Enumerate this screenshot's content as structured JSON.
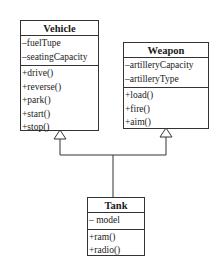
{
  "diagram": {
    "type": "uml-class-diagram",
    "classes": {
      "vehicle": {
        "name": "Vehicle",
        "attributes": [
          "–fuelTupe",
          "–seatingCapacity"
        ],
        "methods": [
          "+drive()",
          "+reverse()",
          "+park()",
          "+start()",
          "+stop()"
        ]
      },
      "weapon": {
        "name": "Weapon",
        "attributes": [
          "–artilleryCapacity",
          "–artilleryType"
        ],
        "methods": [
          "+load()",
          "+fire()",
          "+aim()"
        ]
      },
      "tank": {
        "name": "Tank",
        "attributes": [
          "– model"
        ],
        "methods": [
          "+ram()",
          "+radio()"
        ]
      }
    },
    "relationships": [
      {
        "from": "Tank",
        "to": "Vehicle",
        "type": "generalization"
      },
      {
        "from": "Tank",
        "to": "Weapon",
        "type": "generalization"
      }
    ],
    "colors": {
      "line": "#333333",
      "background": "#ffffff",
      "text": "#1a1a1a"
    }
  }
}
